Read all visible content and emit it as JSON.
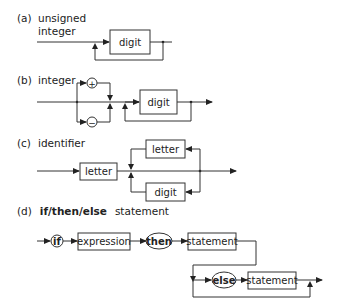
{
  "diagrams": {
    "a": {
      "tag": "(a)",
      "title_line1": "unsigned",
      "title_line2": "integer",
      "nodes": [
        "digit"
      ]
    },
    "b": {
      "tag": "(b)",
      "title": "integer",
      "signs": [
        "+",
        "−"
      ],
      "nodes": [
        "digit"
      ]
    },
    "c": {
      "tag": "(c)",
      "title": "identifier",
      "nodes": [
        "letter",
        "letter",
        "digit"
      ]
    },
    "d": {
      "tag": "(d)",
      "title_keywords": "if/then/else",
      "title_rest": "statement",
      "keywords": [
        "if",
        "then",
        "else"
      ],
      "nodes": [
        "expression",
        "statement",
        "statement"
      ]
    }
  },
  "colors": {
    "line": "#333333",
    "background": "#ffffff",
    "text": "#222222"
  }
}
